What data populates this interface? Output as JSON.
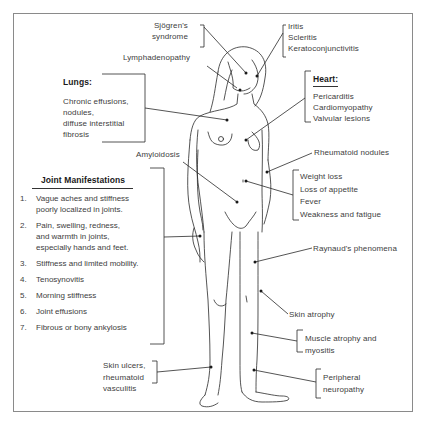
{
  "diagram": {
    "labels": {
      "sjogren": "Sjögren's\nsyndrome",
      "eye": "Iritis\nScleritis\nKeratoconjunctivitis",
      "lymph": "Lymphadenopathy",
      "lungs_title": "Lungs:",
      "lungs_body": "Chronic effusions,\nnodules,\ndiffuse interstitial\nfibrosis",
      "heart_title": "Heart:",
      "heart_body": "Pericarditis\nCardiomyopathy\nValvular lesions",
      "amyloidosis": "Amyloidosis",
      "rheumatoid_nodules": "Rheumatoid nodules",
      "systemic": "Weight loss\nLoss of appetite\nFever\nWeakness and fatigue",
      "raynaud": "Raynaud's phenomena",
      "skin_atrophy": "Skin atrophy",
      "muscle": "Muscle atrophy and\nmyositis",
      "skin_ulcers": "Skin ulcers,\nrheumatoid\nvasculitis",
      "neuropathy": "Peripheral\nneuropathy"
    },
    "joint_manifestations": {
      "title": "Joint Manifestations",
      "items": [
        {
          "num": "1.",
          "text": "Vague aches and stiffness\npoorly localized in joints."
        },
        {
          "num": "2.",
          "text": "Pain, swelling, redness,\nand warmth in joints,\nespecially hands and feet."
        },
        {
          "num": "3.",
          "text": "Stiffness and limited mobility."
        },
        {
          "num": "4.",
          "text": "Tenosynovitis"
        },
        {
          "num": "5.",
          "text": "Morning stiffness"
        },
        {
          "num": "6.",
          "text": "Joint effusions"
        },
        {
          "num": "7.",
          "text": "Fibrous or bony ankylosis"
        }
      ]
    },
    "colors": {
      "line": "#2a2a2a",
      "text": "#404040",
      "frame": "#8a8a8a"
    }
  }
}
